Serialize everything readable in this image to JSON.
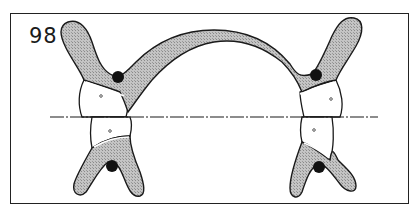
{
  "figure": {
    "number": "98",
    "colors": {
      "outline": "#1a1a1a",
      "bone_fill": "#b8b8b8",
      "tooth_fill": "#ffffff",
      "canal_dot": "#111111",
      "frame": "#222222"
    },
    "occlusal_plane": {
      "style": "dash-dot",
      "y": 117,
      "x_start": 50,
      "x_end": 378
    },
    "parts": [
      {
        "id": "left-upper-bone",
        "has_canal_dot": true
      },
      {
        "id": "right-upper-bone",
        "has_canal_dot": true
      },
      {
        "id": "arch-connector"
      },
      {
        "id": "left-lower-bone",
        "has_canal_dot": true
      },
      {
        "id": "right-lower-bone",
        "has_canal_dot": true
      },
      {
        "id": "left-upper-tooth"
      },
      {
        "id": "left-lower-tooth"
      },
      {
        "id": "right-upper-tooth"
      },
      {
        "id": "right-lower-tooth"
      }
    ]
  }
}
